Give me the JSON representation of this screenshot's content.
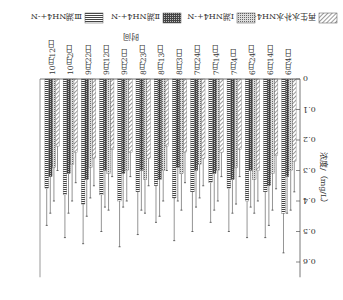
{
  "chart_data": {
    "type": "bar",
    "title": "",
    "xlabel": "时间",
    "ylabel": "浓度/（mg/L）",
    "ylim": [
      0,
      0.65
    ],
    "yticks": [
      "0",
      "0.1",
      "0.2",
      "0.3",
      "0.4",
      "0.5",
      "0.6"
    ],
    "grid": false,
    "legend_position": "bottom",
    "rendered_rotation_deg": 180,
    "categories": [
      "6月4日",
      "6月14日",
      "6月24日",
      "7月4日",
      "7月14日",
      "7月24日",
      "8月3日",
      "8月13日",
      "8月23日",
      "9月2日",
      "9月12日",
      "9月22日",
      "10月2日",
      "10月12日"
    ],
    "series": [
      {
        "name": "再生水补水NH4+-N",
        "pattern": "diagonal",
        "values": [
          0.27,
          0.25,
          0.3,
          0.23,
          0.24,
          0.26,
          0.24,
          0.22,
          0.26,
          0.24,
          0.23,
          0.26,
          0.24,
          0.22
        ],
        "errors": [
          0.1,
          0.11,
          0.1,
          0.09,
          0.08,
          0.09,
          0.1,
          0.08,
          0.09,
          0.08,
          0.09,
          0.09,
          0.1,
          0.08
        ]
      },
      {
        "name": "Ⅰ湖NH4+-N",
        "pattern": "dotted",
        "values": [
          0.3,
          0.31,
          0.33,
          0.29,
          0.3,
          0.28,
          0.31,
          0.3,
          0.33,
          0.3,
          0.31,
          0.29,
          0.28,
          0.29
        ],
        "errors": [
          0.13,
          0.12,
          0.11,
          0.12,
          0.1,
          0.11,
          0.12,
          0.1,
          0.11,
          0.1,
          0.12,
          0.1,
          0.12,
          0.11
        ]
      },
      {
        "name": "Ⅱ湖NH4+-N",
        "pattern": "dark-crosshatch",
        "values": [
          0.32,
          0.35,
          0.3,
          0.33,
          0.31,
          0.3,
          0.29,
          0.33,
          0.3,
          0.31,
          0.3,
          0.33,
          0.31,
          0.32
        ],
        "errors": [
          0.12,
          0.13,
          0.12,
          0.11,
          0.12,
          0.12,
          0.11,
          0.12,
          0.13,
          0.11,
          0.12,
          0.12,
          0.13,
          0.12
        ]
      },
      {
        "name": "Ⅲ湖NH4+-N",
        "pattern": "horizontal",
        "values": [
          0.44,
          0.37,
          0.4,
          0.36,
          0.34,
          0.37,
          0.39,
          0.35,
          0.37,
          0.4,
          0.38,
          0.41,
          0.38,
          0.36
        ],
        "errors": [
          0.13,
          0.15,
          0.12,
          0.14,
          0.13,
          0.13,
          0.14,
          0.12,
          0.14,
          0.15,
          0.12,
          0.13,
          0.14,
          0.12
        ]
      }
    ]
  }
}
